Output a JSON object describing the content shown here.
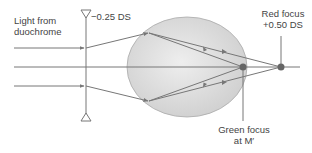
{
  "labels": {
    "source_line1": "Light from",
    "source_line2": "duochrome",
    "lens_power": "−0.25 DS",
    "red_focus_line1": "Red focus",
    "red_focus_line2": "+0.50 DS",
    "green_focus_line1": "Green focus",
    "green_focus_line2": "at M′"
  },
  "colors": {
    "line": "#777777",
    "eye_fill": "#d6d6d6",
    "eye_stroke": "#999999",
    "focus_dot": "#666666"
  },
  "geometry": {
    "axis_y": 67,
    "lens_x": 86,
    "eye": {
      "cx": 185,
      "cy": 67,
      "rx": 60,
      "ry": 50
    },
    "green_focus": {
      "x": 243,
      "y": 67
    },
    "red_focus": {
      "x": 281,
      "y": 67
    }
  }
}
